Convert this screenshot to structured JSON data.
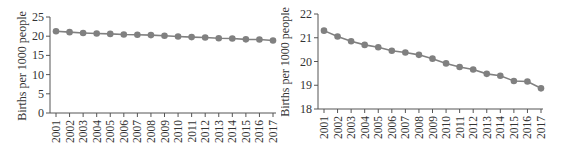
{
  "chart_data": [
    {
      "type": "line",
      "title": "",
      "xlabel": "",
      "ylabel": "Births per 1000 people",
      "x": [
        "2001",
        "2002",
        "2003",
        "2004",
        "2005",
        "2006",
        "2007",
        "2008",
        "2009",
        "2010",
        "2011",
        "2012",
        "2013",
        "2014",
        "2015",
        "2016",
        "2017"
      ],
      "series": [
        {
          "name": "Births per 1000 people",
          "values": [
            21.3,
            21.05,
            20.85,
            20.7,
            20.6,
            20.45,
            20.38,
            20.28,
            20.12,
            19.92,
            19.77,
            19.66,
            19.48,
            19.4,
            19.18,
            19.16,
            18.87
          ]
        }
      ],
      "ylim": [
        0,
        25
      ],
      "yticks": [
        0,
        5,
        10,
        15,
        20,
        25
      ],
      "grid": false,
      "legend": "none",
      "color": "#808080"
    },
    {
      "type": "line",
      "title": "",
      "xlabel": "",
      "ylabel": "Births per 1000 people",
      "x": [
        "2001",
        "2002",
        "2003",
        "2004",
        "2005",
        "2006",
        "2007",
        "2008",
        "2009",
        "2010",
        "2011",
        "2012",
        "2013",
        "2014",
        "2015",
        "2016",
        "2017"
      ],
      "series": [
        {
          "name": "Births per 1000 people",
          "values": [
            21.3,
            21.05,
            20.85,
            20.7,
            20.6,
            20.45,
            20.38,
            20.28,
            20.12,
            19.92,
            19.77,
            19.66,
            19.48,
            19.4,
            19.18,
            19.16,
            18.87
          ]
        }
      ],
      "ylim": [
        18,
        22
      ],
      "yticks": [
        18,
        19,
        20,
        21,
        22
      ],
      "grid": false,
      "legend": "none",
      "color": "#808080"
    }
  ],
  "charts": {
    "left": {
      "ylabel": "Births per 1000 people"
    },
    "right": {
      "ylabel": "Births per 1000 people"
    }
  }
}
